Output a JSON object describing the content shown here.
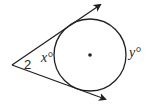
{
  "diagram": {
    "type": "circle with two tangents from an external point",
    "angle_label": "2",
    "near_arc_label": "x°",
    "far_arc_label": "y°",
    "colors": {
      "stroke": "#231f20",
      "background": "#ffffff"
    }
  }
}
